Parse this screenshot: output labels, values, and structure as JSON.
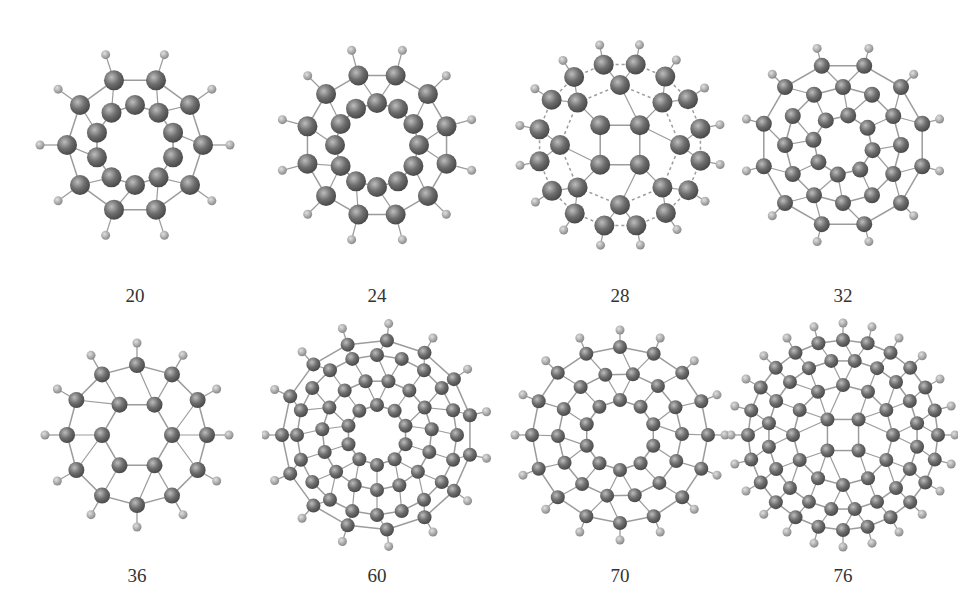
{
  "figure": {
    "panels": [
      {
        "label": "20",
        "carbons": 20,
        "style": "dodecahedrane",
        "rings": [
          {
            "r": 40,
            "n": 10,
            "rot": 0
          },
          {
            "r": 68,
            "n": 10,
            "rot": 18
          }
        ],
        "h_ring": 95
      },
      {
        "label": "24",
        "carbons": 24,
        "style": "cage",
        "rings": [
          {
            "r": 42,
            "n": 12,
            "rot": 0
          },
          {
            "r": 72,
            "n": 12,
            "rot": 15
          }
        ],
        "h_ring": 98
      },
      {
        "label": "28",
        "carbons": 28,
        "style": "cage-dashed",
        "rings": [
          {
            "r": 28,
            "n": 4,
            "rot": 45
          },
          {
            "r": 60,
            "n": 8,
            "rot": 0
          },
          {
            "r": 82,
            "n": 16,
            "rot": 11
          }
        ],
        "h_ring": 102
      },
      {
        "label": "32",
        "carbons": 32,
        "style": "cage-dense",
        "rings": [
          {
            "r": 30,
            "n": 8,
            "rot": 10
          },
          {
            "r": 58,
            "n": 12,
            "rot": 0
          },
          {
            "r": 82,
            "n": 12,
            "rot": 15
          }
        ],
        "h_ring": 100
      },
      {
        "label": "36",
        "carbons": 36,
        "style": "cage",
        "rings": [
          {
            "r": 35,
            "n": 6,
            "rot": 30
          },
          {
            "r": 70,
            "n": 12,
            "rot": 0
          }
        ],
        "h_ring": 92
      },
      {
        "label": "60",
        "carbons": 60,
        "style": "cage-dense",
        "rings": [
          {
            "r": 30,
            "n": 10,
            "rot": 0
          },
          {
            "r": 55,
            "n": 15,
            "rot": 12
          },
          {
            "r": 80,
            "n": 20,
            "rot": 0
          },
          {
            "r": 95,
            "n": 15,
            "rot": 6
          }
        ],
        "h_ring": 112
      },
      {
        "label": "70",
        "carbons": 70,
        "style": "cage-sparse",
        "rings": [
          {
            "r": 35,
            "n": 10,
            "rot": 0
          },
          {
            "r": 62,
            "n": 14,
            "rot": 12
          },
          {
            "r": 88,
            "n": 16,
            "rot": 0
          }
        ],
        "h_ring": 105
      },
      {
        "label": "76",
        "carbons": 76,
        "style": "cage-dense",
        "rings": [
          {
            "r": 22,
            "n": 4,
            "rot": 45
          },
          {
            "r": 50,
            "n": 12,
            "rot": 0
          },
          {
            "r": 75,
            "n": 20,
            "rot": 9
          },
          {
            "r": 95,
            "n": 24,
            "rot": 0
          }
        ],
        "h_ring": 112
      }
    ],
    "colors": {
      "carbon": "#6e6e6e",
      "carbon_highlight": "#bdbdbd",
      "hydrogen": "#9a9a9a",
      "bond": "#9c9c9c",
      "label": "#333333",
      "background": "#ffffff"
    }
  }
}
